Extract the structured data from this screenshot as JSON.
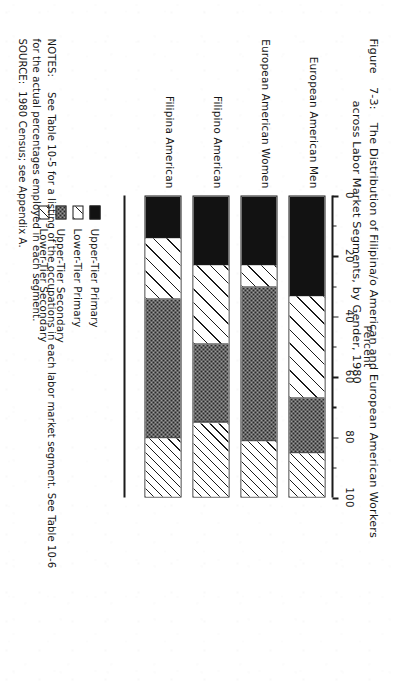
{
  "figure": {
    "label": "Figure",
    "number": "7-3:",
    "title_line1": "The Distribution of Filipina/o American and European American Workers",
    "title_line2": "across Labor Market Segments, by Gender, 1980"
  },
  "axis": {
    "title": "Percent",
    "ticks": [
      "0",
      "20",
      "40",
      "60",
      "80",
      "100"
    ],
    "min": 0,
    "max": 100,
    "minor_step": 10
  },
  "legend": {
    "items": [
      {
        "label": "Upper-Tier Primary",
        "pattern": "solid-black",
        "color": "#121212"
      },
      {
        "label": "Lower-Tier Primary",
        "pattern": "sparse-diagonal-hatch",
        "color": "#ffffff"
      },
      {
        "label": "Upper-Tier Secondary",
        "pattern": "grey-stipple",
        "color": "#9a9a9a"
      },
      {
        "label": "Lower-Tier Secondary",
        "pattern": "dense-diagonal-hatch",
        "color": "#ffffff"
      }
    ]
  },
  "notes": {
    "notes_key": "NOTES:",
    "notes_text_line1": "See Table 10-5 for a listing of the occupations in each labor market segment.  See Table 10-6",
    "notes_text_line2": "for the actual percentages employed in each segment.",
    "source_key": "SOURCE:",
    "source_text": "1980 Census; see Appendix A."
  },
  "chart_data": {
    "type": "bar",
    "orientation": "horizontal-stacked",
    "xlabel": "Percent",
    "ylabel": "",
    "xlim": [
      0,
      100
    ],
    "xticks": [
      0,
      20,
      40,
      60,
      80,
      100
    ],
    "grid": false,
    "legend_position": "below-right",
    "categories": [
      "European American Men",
      "European American Women",
      "Filipino American",
      "Filipina American"
    ],
    "series": [
      {
        "name": "Upper-Tier Primary",
        "values": [
          33,
          23,
          23,
          14
        ]
      },
      {
        "name": "Lower-Tier Primary",
        "values": [
          34,
          7,
          26,
          20
        ]
      },
      {
        "name": "Upper-Tier Secondary",
        "values": [
          18,
          51,
          26,
          46
        ]
      },
      {
        "name": "Lower-Tier Secondary",
        "values": [
          15,
          19,
          25,
          20
        ]
      }
    ],
    "cumulative_boundaries": [
      [
        33,
        67,
        85,
        100
      ],
      [
        23,
        30,
        81,
        100
      ],
      [
        23,
        49,
        75,
        100
      ],
      [
        14,
        34,
        80,
        100
      ]
    ]
  }
}
